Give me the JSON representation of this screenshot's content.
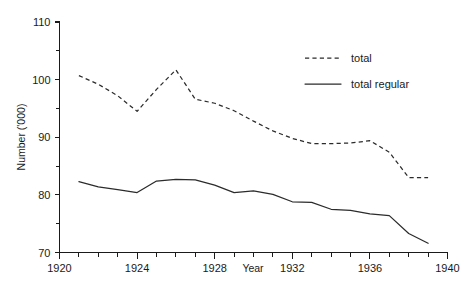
{
  "chart_data": {
    "type": "line",
    "title": "",
    "xlabel": "Year",
    "ylabel": "Number ('000)",
    "xlim": [
      1920,
      1940
    ],
    "ylim": [
      70,
      110
    ],
    "x_major_ticks": [
      1920,
      1924,
      1928,
      1932,
      1936,
      1940
    ],
    "x_tick_labels": [
      "1920",
      "1924",
      "1928",
      "1932",
      "1936",
      "1940"
    ],
    "x_minor_step": 1,
    "y_major_ticks": [
      70,
      80,
      90,
      100,
      110
    ],
    "y_tick_labels": [
      "70",
      "80",
      "90",
      "100",
      "110"
    ],
    "y_minor_ticks": [
      75,
      85,
      95,
      105
    ],
    "grid": false,
    "legend_position": "top-right",
    "x": [
      1921,
      1922,
      1923,
      1924,
      1925,
      1926,
      1927,
      1928,
      1929,
      1930,
      1931,
      1932,
      1933,
      1934,
      1935,
      1936,
      1937,
      1938,
      1939
    ],
    "series": [
      {
        "name": "total",
        "style": "dashed",
        "color": "#2b2b2b",
        "values": [
          100.7,
          99.2,
          97.2,
          94.5,
          98.3,
          101.7,
          96.6,
          95.9,
          94.6,
          92.8,
          91.1,
          89.8,
          88.9,
          88.9,
          89.0,
          89.4,
          87.4,
          83.0,
          83.0
        ]
      },
      {
        "name": "total regular",
        "style": "solid",
        "color": "#2b2b2b",
        "values": [
          82.3,
          81.4,
          80.9,
          80.4,
          82.4,
          82.7,
          82.6,
          81.7,
          80.4,
          80.7,
          80.1,
          78.8,
          78.7,
          77.5,
          77.3,
          76.7,
          76.4,
          73.3,
          71.6
        ]
      }
    ],
    "legend": [
      {
        "label": "total",
        "style": "dashed"
      },
      {
        "label": "total regular",
        "style": "solid"
      }
    ]
  }
}
